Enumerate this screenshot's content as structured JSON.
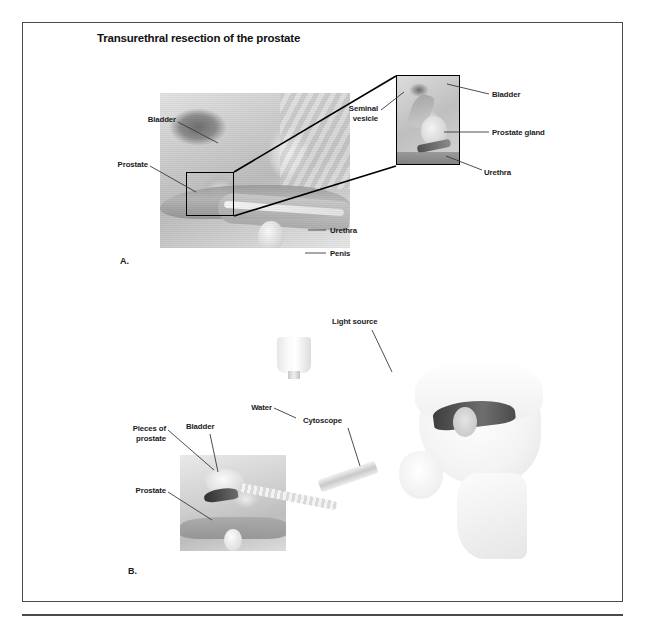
{
  "figure": {
    "title": "Transurethral resection of the prostate",
    "panels": [
      {
        "letter": "A.",
        "name": "sagittal-anatomy-with-magnified-inset",
        "labels": [
          {
            "text": "Bladder",
            "id": "bladder"
          },
          {
            "text": "Prostate",
            "id": "prostate"
          },
          {
            "text": "Urethra",
            "id": "urethra"
          },
          {
            "text": "Penis",
            "id": "penis"
          }
        ],
        "inset_labels": [
          {
            "text": "Seminal\nvesicle",
            "id": "seminal-vesicle"
          },
          {
            "text": "Bladder",
            "id": "inset-bladder"
          },
          {
            "text": "Prostate gland",
            "id": "prostate-gland"
          },
          {
            "text": "Urethra",
            "id": "inset-urethra"
          }
        ]
      },
      {
        "letter": "B.",
        "name": "resection-procedure",
        "labels": [
          {
            "text": "Pieces of\nprostate",
            "id": "pieces-of-prostate"
          },
          {
            "text": "Bladder",
            "id": "b-bladder"
          },
          {
            "text": "Prostate",
            "id": "b-prostate"
          },
          {
            "text": "Water",
            "id": "water"
          },
          {
            "text": "Light source",
            "id": "light-source"
          },
          {
            "text": "Cytoscope",
            "id": "cytoscope"
          }
        ]
      }
    ]
  },
  "colors": {
    "frame_border": "#4a4a4a",
    "label_text": "#1b1b1b",
    "title_text": "#111111",
    "leader_line": "#3a3a3a",
    "roi_outline": "#000000",
    "page_background": "#ffffff"
  }
}
